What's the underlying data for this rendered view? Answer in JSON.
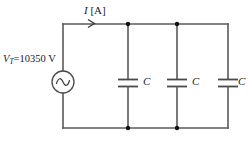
{
  "figure": {
    "type": "circuit-diagram"
  },
  "labels": {
    "current": {
      "symbol": "I",
      "unit": "[A]"
    },
    "source": {
      "symbol": "V",
      "subscript": "T",
      "equals_value": "=10350 V"
    },
    "capacitors": [
      {
        "symbol": "C"
      },
      {
        "symbol": "C"
      },
      {
        "symbol": "C"
      }
    ]
  },
  "colors": {
    "wire": "#5a5a5a",
    "plate": "#4a4a4a",
    "node": "#111111",
    "text": "#1a1a1a",
    "background": "#ffffff"
  },
  "icons": {
    "ac_source": "ac-source-icon",
    "current_arrow": "current-arrow-icon",
    "capacitor": "capacitor-icon",
    "junction": "junction-dot-icon"
  }
}
